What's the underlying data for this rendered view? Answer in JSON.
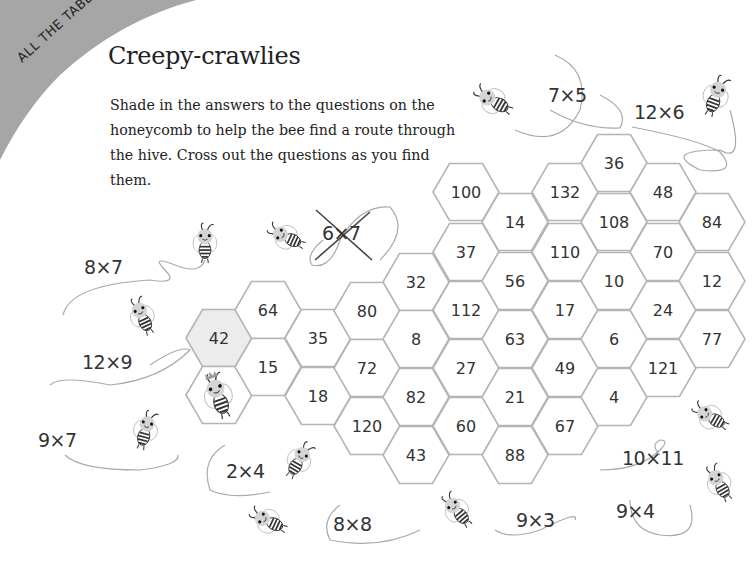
{
  "page": {
    "section_label": "ALL THE TABLES",
    "title": "Creepy-crawlies",
    "instructions": "Shade in the answers to the questions on the honeycomb to help the bee find a route through the hive. Cross out the questions as you find them."
  },
  "colors": {
    "corner_band": "#a6a6a6",
    "hex_stroke": "#b5b5b5",
    "hex_fill": "#ffffff",
    "hex_shaded": "#ececec",
    "text": "#333333"
  },
  "questions": [
    {
      "label": "7x5",
      "text": "7×5",
      "crossed": false
    },
    {
      "label": "12x6",
      "text": "12×6",
      "crossed": false
    },
    {
      "label": "6x7",
      "text": "6×7",
      "crossed": true
    },
    {
      "label": "8x7",
      "text": "8×7",
      "crossed": false
    },
    {
      "label": "12x9",
      "text": "12×9",
      "crossed": false
    },
    {
      "label": "9x7",
      "text": "9×7",
      "crossed": false
    },
    {
      "label": "2x4",
      "text": "2×4",
      "crossed": false
    },
    {
      "label": "8x8",
      "text": "8×8",
      "crossed": false
    },
    {
      "label": "9x3",
      "text": "9×3",
      "crossed": false
    },
    {
      "label": "10x11",
      "text": "10×11",
      "crossed": false
    },
    {
      "label": "9x4",
      "text": "9×4",
      "crossed": false
    }
  ],
  "honeycomb": {
    "cells": [
      {
        "value": "42",
        "shaded": true
      },
      {
        "value": "",
        "bee": true
      },
      {
        "value": "64"
      },
      {
        "value": "15"
      },
      {
        "value": "35"
      },
      {
        "value": "18"
      },
      {
        "value": "80"
      },
      {
        "value": "72"
      },
      {
        "value": "120"
      },
      {
        "value": "32"
      },
      {
        "value": "8"
      },
      {
        "value": "82"
      },
      {
        "value": "43"
      },
      {
        "value": "100"
      },
      {
        "value": "37"
      },
      {
        "value": "112"
      },
      {
        "value": "27"
      },
      {
        "value": "60"
      },
      {
        "value": "14"
      },
      {
        "value": "56"
      },
      {
        "value": "63"
      },
      {
        "value": "21"
      },
      {
        "value": "88"
      },
      {
        "value": "132"
      },
      {
        "value": "110"
      },
      {
        "value": "17"
      },
      {
        "value": "49"
      },
      {
        "value": "67"
      },
      {
        "value": "36"
      },
      {
        "value": "108"
      },
      {
        "value": "10"
      },
      {
        "value": "6"
      },
      {
        "value": "4"
      },
      {
        "value": "48"
      },
      {
        "value": "70"
      },
      {
        "value": "24"
      },
      {
        "value": "121"
      },
      {
        "value": "84"
      },
      {
        "value": "12"
      },
      {
        "value": "77"
      }
    ]
  },
  "icons": {
    "bee": "bee-icon",
    "queen_bee": "queen-bee-icon"
  }
}
